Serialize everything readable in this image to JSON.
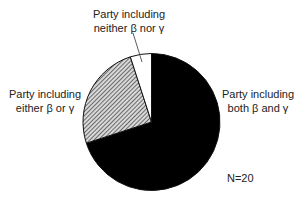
{
  "chart_data": {
    "type": "pie",
    "title": "",
    "total_label": "N=20",
    "total": 20,
    "start_angle_deg": 0,
    "direction": "clockwise",
    "slices": [
      {
        "key": "both",
        "label_lines": [
          "Party including",
          "both β and γ"
        ],
        "label": "Party including both β and γ",
        "value": 14,
        "percent": 70,
        "fill": "#000000",
        "pattern": "solid"
      },
      {
        "key": "either",
        "label_lines": [
          "Party including",
          "either β or γ"
        ],
        "label": "Party including either β or γ",
        "value": 5,
        "percent": 25,
        "fill": "#9a9a9a",
        "pattern": "diagonal-hatch"
      },
      {
        "key": "neither",
        "label_lines": [
          "Party including",
          "neither β nor γ"
        ],
        "label": "Party including neither β nor γ",
        "value": 1,
        "percent": 5,
        "fill": "#ffffff",
        "pattern": "solid"
      }
    ],
    "legend": "none (direct labels)",
    "leader_line": {
      "slice": "neither"
    }
  },
  "labels": {
    "both": {
      "line1": "Party including",
      "line2": "both β and γ"
    },
    "either": {
      "line1": "Party including",
      "line2": "either β or γ"
    },
    "neither": {
      "line1": "Party including",
      "line2": "neither β nor γ"
    },
    "n": "N=20"
  },
  "geometry": {
    "cx": 151.5,
    "cy": 122,
    "r": 68.5
  }
}
